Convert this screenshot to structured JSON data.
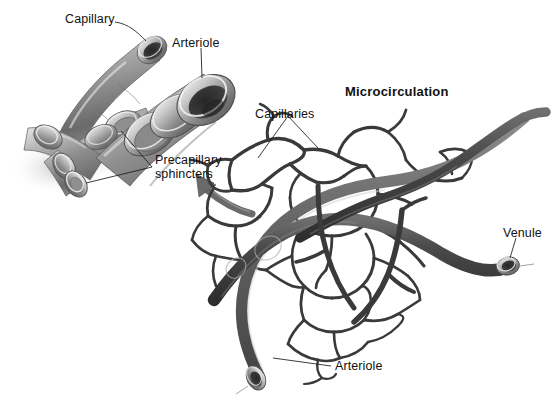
{
  "figure": {
    "title": "Microcirculation",
    "background_color": "#ffffff",
    "ink_color": "#1a1a1a",
    "vessel_dark": "#3c3c3c",
    "vessel_mid": "#6e6e6e",
    "vessel_light": "#b8b8b8"
  },
  "detail_panel": {
    "name": "arteriole-precapillary-sphincter-detail",
    "labels": {
      "capillary": "Capillary",
      "arteriole": "Arteriole",
      "precapillary_sphincters_line1": "Precapillary",
      "precapillary_sphincters_line2": "sphincters"
    }
  },
  "network_panel": {
    "name": "capillary-network",
    "labels": {
      "capillaries": "Capillaries",
      "venule": "Venule",
      "arteriole": "Arteriole"
    }
  },
  "callout_arrow": {
    "name": "magnification-arrow",
    "direction": "up-left",
    "description": "curved arrow from capillary network toward enlarged detail"
  }
}
